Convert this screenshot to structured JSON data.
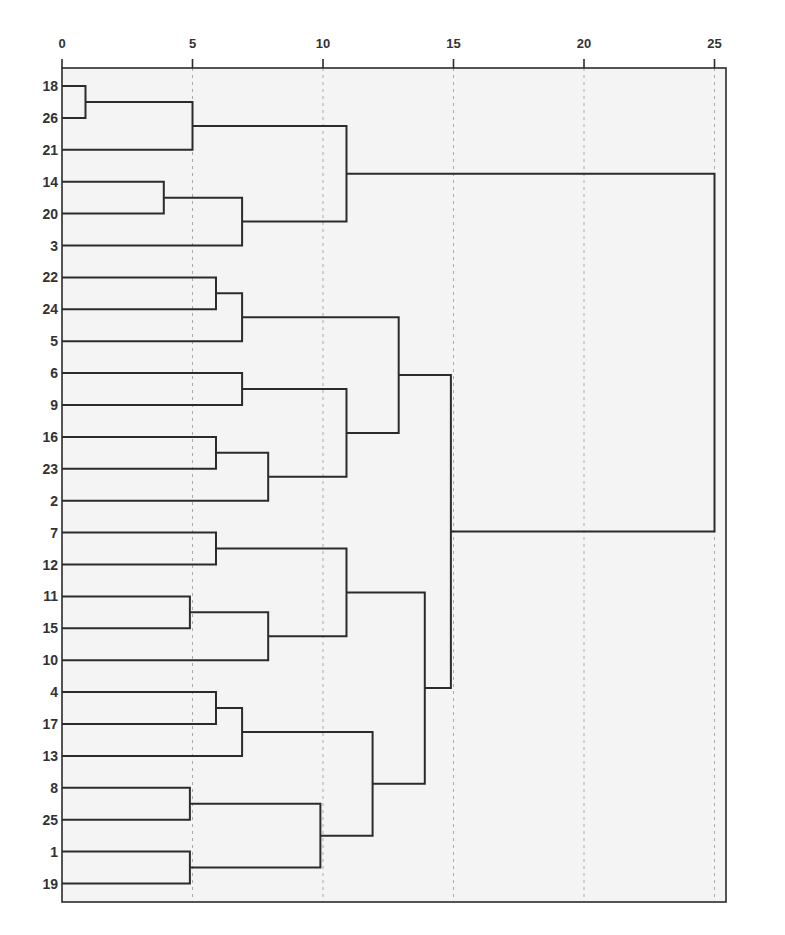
{
  "chart_data": {
    "type": "dendrogram",
    "title": "",
    "xlabel": "",
    "ylabel": "",
    "orientation": "horizontal",
    "xlim": [
      0,
      26
    ],
    "x_ticks": [
      0,
      5,
      10,
      15,
      20,
      25
    ],
    "grid": "vertical dashed lines at 5, 10, 15, 20, 25",
    "leaves": [
      "18",
      "26",
      "21",
      "14",
      "20",
      "3",
      "22",
      "24",
      "5",
      "6",
      "9",
      "16",
      "23",
      "2",
      "7",
      "12",
      "11",
      "15",
      "10",
      "4",
      "17",
      "13",
      "8",
      "25",
      "1",
      "19"
    ],
    "merges": [
      {
        "id": "c1",
        "children": [
          "18",
          "26"
        ],
        "height": 0.9
      },
      {
        "id": "c2",
        "children": [
          "c1",
          "21"
        ],
        "height": 5.0
      },
      {
        "id": "c3",
        "children": [
          "14",
          "20"
        ],
        "height": 3.9
      },
      {
        "id": "c4",
        "children": [
          "c3",
          "3"
        ],
        "height": 6.9
      },
      {
        "id": "c5",
        "children": [
          "c2",
          "c4"
        ],
        "height": 10.9
      },
      {
        "id": "c6",
        "children": [
          "22",
          "24"
        ],
        "height": 5.9
      },
      {
        "id": "c7",
        "children": [
          "c6",
          "5"
        ],
        "height": 6.9
      },
      {
        "id": "c8",
        "children": [
          "6",
          "9"
        ],
        "height": 6.9
      },
      {
        "id": "c9",
        "children": [
          "16",
          "23"
        ],
        "height": 5.9
      },
      {
        "id": "c10",
        "children": [
          "c9",
          "2"
        ],
        "height": 7.9
      },
      {
        "id": "c11",
        "children": [
          "c8",
          "c10"
        ],
        "height": 10.9
      },
      {
        "id": "c12",
        "children": [
          "c7",
          "c11"
        ],
        "height": 12.9
      },
      {
        "id": "c13",
        "children": [
          "7",
          "12"
        ],
        "height": 5.9
      },
      {
        "id": "c14",
        "children": [
          "11",
          "15"
        ],
        "height": 4.9
      },
      {
        "id": "c15",
        "children": [
          "c14",
          "10"
        ],
        "height": 7.9
      },
      {
        "id": "c16",
        "children": [
          "c13",
          "c15"
        ],
        "height": 10.9
      },
      {
        "id": "c17",
        "children": [
          "4",
          "17"
        ],
        "height": 5.9
      },
      {
        "id": "c18",
        "children": [
          "c17",
          "13"
        ],
        "height": 6.9
      },
      {
        "id": "c19",
        "children": [
          "8",
          "25"
        ],
        "height": 4.9
      },
      {
        "id": "c20",
        "children": [
          "1",
          "19"
        ],
        "height": 4.9
      },
      {
        "id": "c21",
        "children": [
          "c19",
          "c20"
        ],
        "height": 9.9
      },
      {
        "id": "c22",
        "children": [
          "c18",
          "c21"
        ],
        "height": 11.9
      },
      {
        "id": "c23",
        "children": [
          "c16",
          "c22"
        ],
        "height": 13.9
      },
      {
        "id": "c24",
        "children": [
          "c12",
          "c23"
        ],
        "height": 14.9
      },
      {
        "id": "c25",
        "children": [
          "c5",
          "c24"
        ],
        "height": 25.0
      }
    ]
  },
  "colors": {
    "line": "#2b2b2b",
    "grid": "#aaaaaa",
    "plot_bg": "#f4f4f4",
    "page_bg": "#ffffff"
  }
}
